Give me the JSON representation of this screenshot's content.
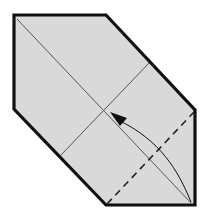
{
  "diagram": {
    "kind": "origami-step",
    "colors": {
      "paper": "#d9d9d9",
      "outline": "#111111",
      "crease": "#555555",
      "valley_fold": "#222222",
      "arrow": "#111111",
      "background": "#ffffff"
    },
    "elements": [
      {
        "name": "paper-outline",
        "type": "polygon",
        "style": "solid-thick"
      },
      {
        "name": "diagonal-crease",
        "type": "line",
        "style": "thin"
      },
      {
        "name": "cross-crease",
        "type": "line",
        "style": "thin"
      },
      {
        "name": "valley-fold-line",
        "type": "line",
        "style": "dashed"
      },
      {
        "name": "fold-arrow",
        "type": "curved-arrow",
        "direction": "up-left"
      }
    ]
  }
}
